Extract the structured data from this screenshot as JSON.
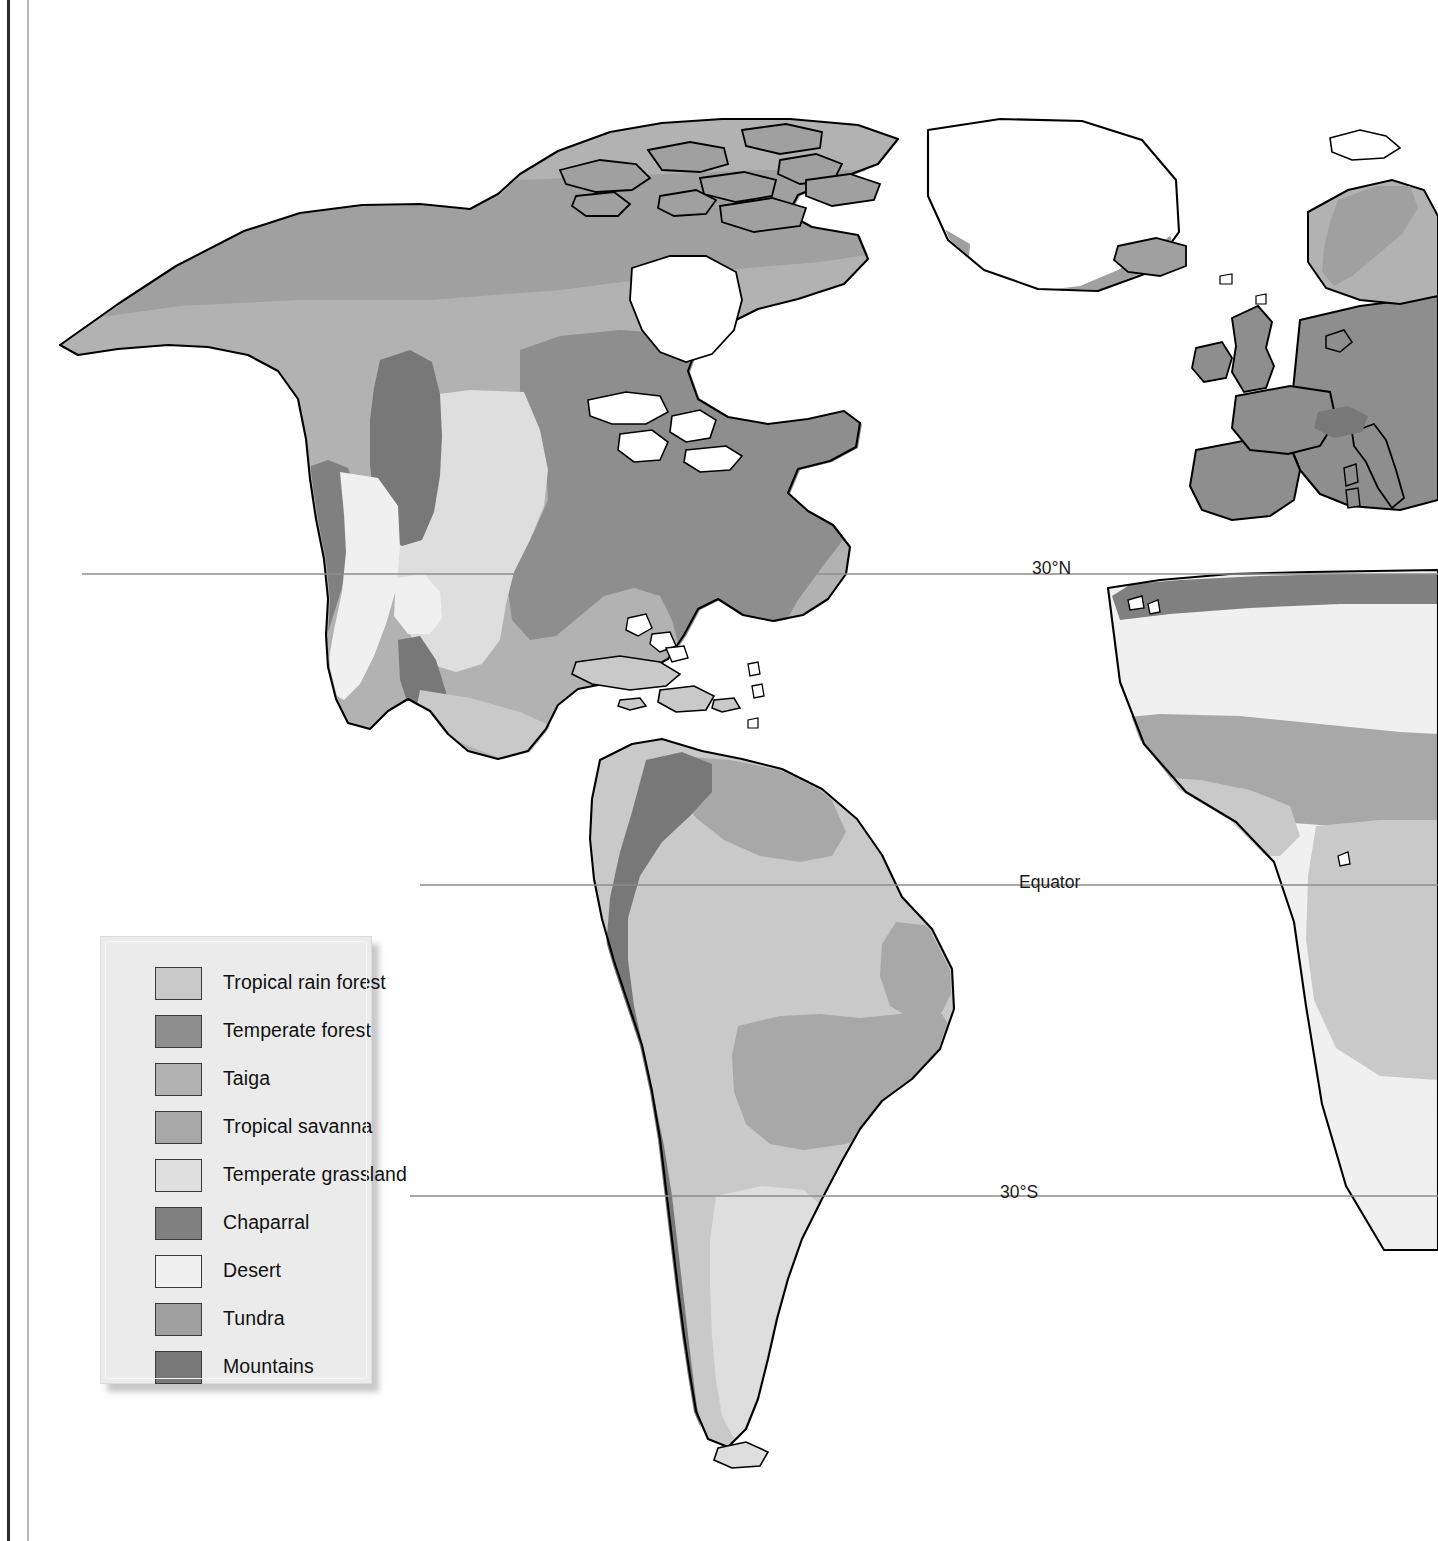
{
  "page": {
    "background_color": "#ffffff"
  },
  "margin_rules": {
    "dark_rule_color": "#2b2b2b",
    "light_rule_color": "#b9b9b9"
  },
  "map": {
    "name": "world-biome-map",
    "projection_note": "Western hemisphere centered, Americas with Europe and West Africa at right edge",
    "outline_color": "#000000",
    "ocean_color": "#ffffff",
    "latitude_lines": [
      {
        "id": "lat-30n",
        "label": "30°N",
        "y": 574
      },
      {
        "id": "lat-eq",
        "label": "Equator",
        "y": 885
      },
      {
        "id": "lat-30s",
        "label": "30°S",
        "y": 1196
      }
    ],
    "latitude_line_color": "#8c8c8c"
  },
  "legend": {
    "name": "biome-legend",
    "background_color": "#ebebeb",
    "items": [
      {
        "label": "Tropical rain forest",
        "color": "#c9c9c9",
        "key": "tropical-rain-forest"
      },
      {
        "label": "Temperate forest",
        "color": "#8e8e8e",
        "key": "temperate-forest"
      },
      {
        "label": "Taiga",
        "color": "#b2b2b2",
        "key": "taiga"
      },
      {
        "label": "Tropical savanna",
        "color": "#a8a8a8",
        "key": "tropical-savanna"
      },
      {
        "label": "Temperate grassland",
        "color": "#dedede",
        "key": "temperate-grassland"
      },
      {
        "label": "Chaparral",
        "color": "#808080",
        "key": "chaparral"
      },
      {
        "label": "Desert",
        "color": "#f0f0f0",
        "key": "desert"
      },
      {
        "label": "Tundra",
        "color": "#a0a0a0",
        "key": "tundra"
      },
      {
        "label": "Mountains",
        "color": "#787878",
        "key": "mountains"
      }
    ]
  }
}
